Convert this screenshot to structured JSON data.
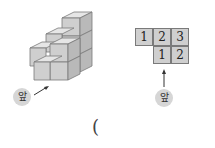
{
  "left_figure": {
    "description": "stacked cube structure",
    "front_label": "앞"
  },
  "right_figure": {
    "description": "top view with cube counts",
    "grid": {
      "top_row": [
        "1",
        "2",
        "3"
      ],
      "bottom_row": [
        "",
        "1",
        "2"
      ]
    },
    "front_label": "앞"
  },
  "answer_paren": "("
}
